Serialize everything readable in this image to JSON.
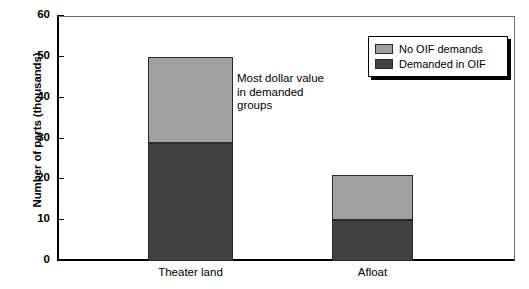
{
  "chart_data": {
    "type": "bar",
    "subtype": "stacked-bar",
    "title": "",
    "subtitle": "",
    "xlabel": "",
    "ylabel": "Number of parts (thousands)",
    "categories": [
      "Theater land",
      "Afloat"
    ],
    "series": [
      {
        "name": "Demanded in OIF",
        "values": [
          29,
          10
        ],
        "color": "#404040"
      },
      {
        "name": "No OIF demands",
        "values": [
          21,
          11
        ],
        "color": "#a0a0a0"
      }
    ],
    "stack_totals": [
      50,
      21
    ],
    "ylim": [
      0,
      60
    ],
    "ytick_values": [
      0,
      10,
      20,
      30,
      40,
      50,
      60
    ],
    "ytick_labels": [
      "0",
      "10",
      "20",
      "30",
      "40",
      "50",
      "60"
    ],
    "grid": false,
    "legend_position": "top-right",
    "legend_entries": [
      "No OIF demands",
      "Demanded in OIF"
    ],
    "annotations": [
      {
        "name": "most-dollar-value-note",
        "lines": [
          "Most dollar value",
          "in demanded",
          "groups"
        ],
        "x": 237,
        "y": 72
      }
    ]
  },
  "axis": {
    "y_title": "Number of parts (thousands)",
    "ticks": [
      {
        "label": "60",
        "value": 60
      },
      {
        "label": "50",
        "value": 50
      },
      {
        "label": "40",
        "value": 40
      },
      {
        "label": "30",
        "value": 30
      },
      {
        "label": "20",
        "value": 20
      },
      {
        "label": "10",
        "value": 10
      },
      {
        "label": "0",
        "value": 0
      }
    ],
    "x_categories": [
      {
        "label": "Theater land"
      },
      {
        "label": "Afloat"
      }
    ]
  },
  "legend": {
    "items": [
      {
        "label": "No OIF demands",
        "color": "#a0a0a0"
      },
      {
        "label": "Demanded in OIF",
        "color": "#404040"
      }
    ]
  },
  "annotation": {
    "line1": "Most dollar value",
    "line2": "in demanded",
    "line3": "groups"
  },
  "colors": {
    "light_gray": "#a0a0a0",
    "dark_gray": "#404040",
    "axis": "#000000",
    "background": "#ffffff"
  }
}
